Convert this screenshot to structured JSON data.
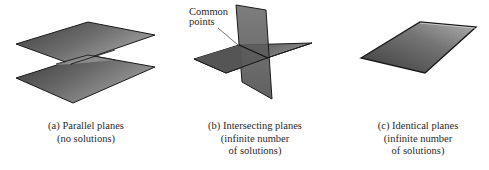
{
  "figure": {
    "panels": [
      {
        "id": "a",
        "caption_lines": [
          "(a) Parallel planes",
          "(no solutions)"
        ]
      },
      {
        "id": "b",
        "caption_lines": [
          "(b) Intersecting planes",
          "(infinite number",
          "of solutions)"
        ],
        "callout_lines": [
          "Common",
          "points"
        ]
      },
      {
        "id": "c",
        "caption_lines": [
          "(c) Identical planes",
          "(infinite number",
          "of solutions)"
        ]
      }
    ],
    "colors": {
      "plane_dark": "#4a4a4a",
      "plane_light": "#9a9a9a",
      "edge": "#1a1a1a",
      "background": "#ffffff"
    }
  }
}
